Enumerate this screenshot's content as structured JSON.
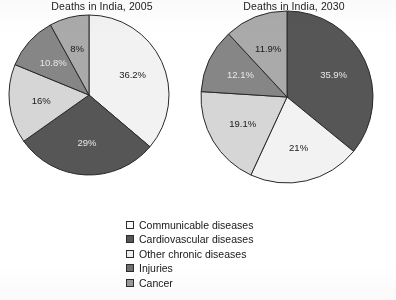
{
  "page": {
    "background_color": "#ffffff"
  },
  "chart_data": [
    {
      "type": "pie",
      "title": "Deaths in India, 2005",
      "categories": [
        "Communicable diseases",
        "Cardiovascular diseases",
        "Other chronic diseases",
        "Injuries",
        "Cancer"
      ],
      "values": [
        36.2,
        29,
        16,
        10.8,
        8
      ],
      "labels": [
        "36.2%",
        "29%",
        "16%",
        "10.8%",
        "8%"
      ],
      "colors": [
        "#f2f2f2",
        "#565656",
        "#d6d6d6",
        "#868686",
        "#aaaaaa"
      ],
      "label_text_colors": [
        "#1a1a1a",
        "#e8e8e8",
        "#1a1a1a",
        "#e8e8e8",
        "#1a1a1a"
      ],
      "start_angle_deg": 0,
      "direction": "clockwise",
      "units": "percent"
    },
    {
      "type": "pie",
      "title": "Deaths in India, 2030",
      "categories": [
        "Cardiovascular diseases",
        "Communicable diseases",
        "Other chronic diseases",
        "Injuries",
        "Cancer"
      ],
      "values": [
        35.9,
        21,
        19.1,
        12.1,
        11.9
      ],
      "labels": [
        "35.9%",
        "21%",
        "19.1%",
        "12.1%",
        "11.9%"
      ],
      "colors": [
        "#565656",
        "#f2f2f2",
        "#d6d6d6",
        "#868686",
        "#aaaaaa"
      ],
      "label_text_colors": [
        "#e8e8e8",
        "#1a1a1a",
        "#1a1a1a",
        "#e8e8e8",
        "#1a1a1a"
      ],
      "start_angle_deg": 0,
      "direction": "clockwise",
      "units": "percent"
    }
  ],
  "legend": {
    "position": "bottom-center",
    "items": [
      {
        "label": "Communicable diseases",
        "color": "#f8f8f8"
      },
      {
        "label": "Cardiovascular diseases",
        "color": "#565656"
      },
      {
        "label": "Other chronic diseases",
        "color": "#ededed"
      },
      {
        "label": "Injuries",
        "color": "#6f6f6f"
      },
      {
        "label": "Cancer",
        "color": "#9a9a9a"
      }
    ]
  }
}
